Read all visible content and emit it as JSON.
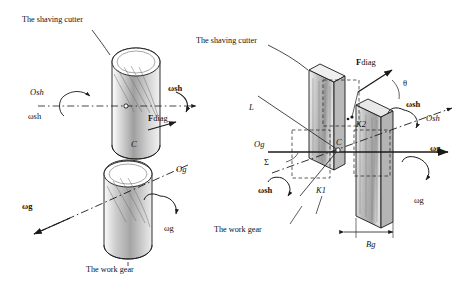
{
  "figure": {
    "panels": [
      {
        "id": "left",
        "caption_top": "The shaving cutter",
        "caption_bottom": "The work gear",
        "labels": [
          {
            "key": "O_sh",
            "text": "O",
            "sub": "sh"
          },
          {
            "key": "omega_sh_vec",
            "text": "ω",
            "sub": "sh"
          },
          {
            "key": "omega_sh",
            "text": "ω",
            "sub": "sh"
          },
          {
            "key": "F_diag",
            "text": "F",
            "sub": "diag"
          },
          {
            "key": "C",
            "text": "C"
          },
          {
            "key": "O_g",
            "text": "O",
            "sub": "g"
          },
          {
            "key": "omega_g_vec",
            "text": "ω",
            "sub": "g"
          },
          {
            "key": "omega_g",
            "text": "ω",
            "sub": "g"
          }
        ]
      },
      {
        "id": "right",
        "caption_top": "The shaving cutter",
        "caption_bottom": "The work gear",
        "labels": [
          {
            "key": "L",
            "text": "L"
          },
          {
            "key": "F_diag",
            "text": "F",
            "sub": "diag"
          },
          {
            "key": "theta",
            "text": "θ"
          },
          {
            "key": "omega_sh_vec",
            "text": "ω",
            "sub": "sh"
          },
          {
            "key": "K2",
            "text": "K",
            "sub": "2"
          },
          {
            "key": "O_sh",
            "text": "O",
            "sub": "sh"
          },
          {
            "key": "O_g",
            "text": "O",
            "sub": "g"
          },
          {
            "key": "Sigma",
            "text": "Σ"
          },
          {
            "key": "C",
            "text": "C"
          },
          {
            "key": "omega_g_vec",
            "text": "ω",
            "sub": "g"
          },
          {
            "key": "omega_sh",
            "text": "ω",
            "sub": "sh"
          },
          {
            "key": "K1",
            "text": "K",
            "sub": "1"
          },
          {
            "key": "omega_g",
            "text": "ω",
            "sub": "g"
          },
          {
            "key": "B_g",
            "text": "B",
            "sub": "g"
          }
        ]
      }
    ],
    "text": {
      "shaving_cutter": "The shaving cutter",
      "work_gear": "The work gear",
      "O": "O",
      "sh": "sh",
      "g": "g",
      "F": "F",
      "diag": "diag",
      "omega": "ω",
      "C": "C",
      "L": "L",
      "theta": "θ",
      "K": "K",
      "one": "1",
      "two": "2",
      "Sigma": "Σ",
      "B": "B"
    },
    "colors": {
      "stroke": "#1a1a1a",
      "fill_light": "#e2e2e2",
      "fill_mid": "#bdbdbd",
      "fill_dark": "#9a9a9a",
      "background": "#ffffff"
    }
  }
}
